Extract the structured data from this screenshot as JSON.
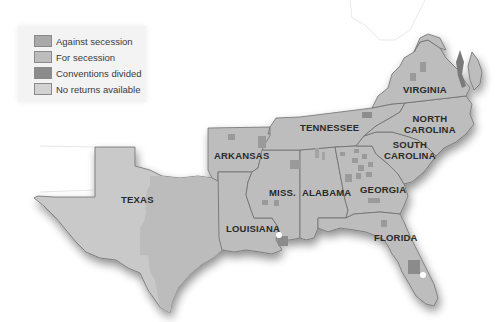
{
  "legend": {
    "items": [
      {
        "label": "Against secession",
        "color": "#a9a9a9"
      },
      {
        "label": "For secession",
        "color": "#bdbdbd"
      },
      {
        "label": "Conventions divided",
        "color": "#8b8b8b"
      },
      {
        "label": "No returns available",
        "color": "#d2d2d2"
      }
    ]
  },
  "states": {
    "virginia": "VIRGINIA",
    "north_carolina_1": "NORTH",
    "north_carolina_2": "CAROLINA",
    "tennessee": "TENNESSEE",
    "south_carolina_1": "SOUTH",
    "south_carolina_2": "CAROLINA",
    "arkansas": "ARKANSAS",
    "texas": "TEXAS",
    "miss": "MISS.",
    "alabama": "ALABAMA",
    "georgia": "GEORGIA",
    "louisiana": "LOUISIANA",
    "florida": "FLORIDA"
  },
  "colors": {
    "for_secession": "#bdbdbd",
    "against_secession": "#a9a9a9",
    "divided": "#8b8b8b",
    "no_returns": "#d2d2d2",
    "border": "#6f6f6f"
  }
}
